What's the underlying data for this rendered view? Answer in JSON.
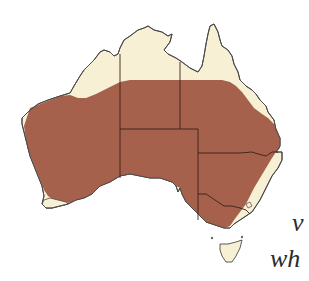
{
  "map": {
    "title": "Australia distribution map",
    "colors": {
      "land": "#f7f0d4",
      "range": "#a5614c",
      "border": "#4a4a4a",
      "state_line": "#3a2018",
      "background": "#ffffff"
    },
    "legend": "Shaded area indicates species range across inland Australia",
    "regions": [
      "Western Australia",
      "Northern Territory",
      "Queensland",
      "South Australia",
      "New South Wales",
      "Victoria",
      "Tasmania",
      "ACT"
    ]
  },
  "caption": {
    "line1": "v",
    "line2": "wh"
  }
}
